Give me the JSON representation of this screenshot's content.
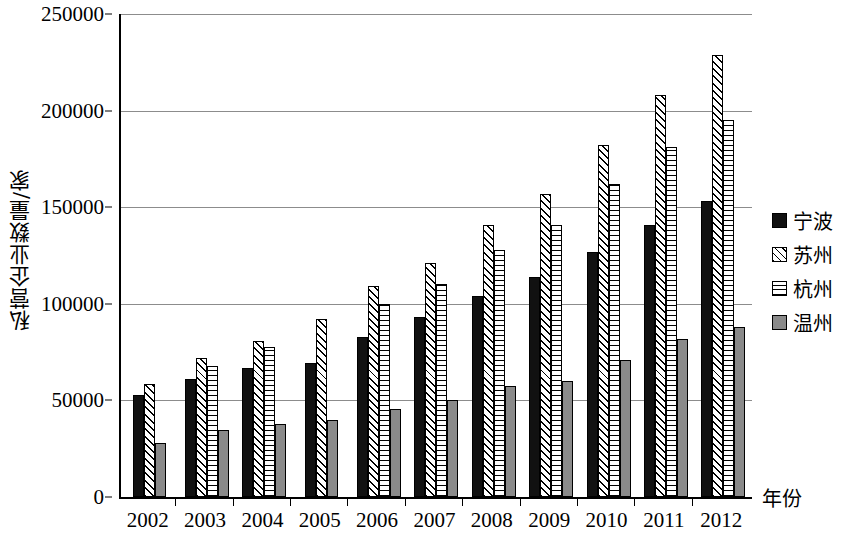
{
  "chart_data": {
    "type": "bar",
    "title": "",
    "xlabel": "年份",
    "ylabel": "私营企业数量/家",
    "categories": [
      "2002",
      "2003",
      "2004",
      "2005",
      "2006",
      "2007",
      "2008",
      "2009",
      "2010",
      "2011",
      "2012"
    ],
    "ylim": [
      0,
      250000
    ],
    "ytick_labels": [
      "0",
      "50000",
      "100000",
      "150000",
      "200000",
      "250000"
    ],
    "yticks": [
      0,
      50000,
      100000,
      150000,
      200000,
      250000
    ],
    "grid": true,
    "legend_position": "right",
    "series": [
      {
        "name": "宁波",
        "fill": "solid-black",
        "color": "#111111",
        "values": [
          53000,
          61000,
          67000,
          69500,
          83000,
          93000,
          104000,
          114000,
          127000,
          141000,
          153000
        ]
      },
      {
        "name": "苏州",
        "fill": "diagonal-hatch",
        "color": "#000000",
        "values": [
          58500,
          72000,
          81000,
          92000,
          109000,
          121000,
          141000,
          157000,
          182000,
          208000,
          229000
        ]
      },
      {
        "name": "杭州",
        "fill": "horizontal-hatch",
        "color": "#000000",
        "values": [
          null,
          68000,
          77500,
          null,
          100000,
          110000,
          128000,
          141000,
          162000,
          181000,
          195000
        ]
      },
      {
        "name": "温州",
        "fill": "solid-gray",
        "color": "#8a8a8a",
        "values": [
          28000,
          34500,
          38000,
          40000,
          45500,
          50000,
          57500,
          60000,
          71000,
          82000,
          88000
        ]
      }
    ]
  },
  "axis": {
    "y_title": "私营企业数量/家",
    "x_title": "年份"
  },
  "legend": {
    "items": [
      {
        "label": "宁波",
        "swatch": "solid-black-swatch"
      },
      {
        "label": "苏州",
        "swatch": "diagonal-hatch-swatch"
      },
      {
        "label": "杭州",
        "swatch": "horizontal-hatch-swatch"
      },
      {
        "label": "温州",
        "swatch": "solid-gray-swatch"
      }
    ]
  }
}
